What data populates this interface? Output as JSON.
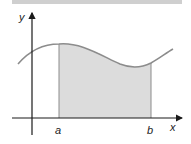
{
  "diagram": {
    "axes": {
      "x_label": "x",
      "y_label": "y"
    },
    "bounds": {
      "lower": "a",
      "upper": "b"
    },
    "colors": {
      "curve": "#8c8c8c",
      "fill": "#dcdcdc",
      "axis": "#1a1a1a",
      "topbar": "#cfcfcf"
    }
  }
}
